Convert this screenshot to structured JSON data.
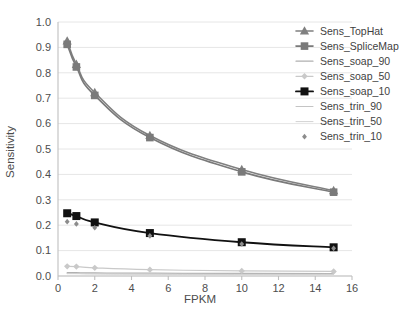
{
  "chart_data": {
    "type": "line",
    "title": "",
    "xlabel": "FPKM",
    "ylabel": "Sensitivity",
    "xlim": [
      0,
      16
    ],
    "ylim": [
      0.0,
      1.0
    ],
    "xticks": [
      0,
      2,
      4,
      6,
      8,
      10,
      12,
      14,
      16
    ],
    "xtick_labels": [
      "0",
      "2",
      "4",
      "6",
      "8",
      "10",
      "12",
      "14",
      "16"
    ],
    "yticks": [
      0.0,
      0.1,
      0.2,
      0.3,
      0.4,
      0.5,
      0.6,
      0.7,
      0.8,
      0.9,
      1.0
    ],
    "ytick_labels": [
      "0.0",
      "0.1",
      "0.2",
      "0.3",
      "0.4",
      "0.5",
      "0.6",
      "0.7",
      "0.8",
      "0.9",
      "1.0"
    ],
    "grid": "horizontal",
    "legend_position": "top-right",
    "x": [
      0.5,
      1,
      2,
      5,
      10,
      15
    ],
    "series": [
      {
        "name": "Sens_TopHat",
        "values": [
          0.925,
          0.833,
          0.722,
          0.553,
          0.419,
          0.336
        ],
        "color": "#808080",
        "marker": "triangle",
        "marker_size": 4.2,
        "line_width": 1.6
      },
      {
        "name": "Sens_SpliceMap",
        "values": [
          0.912,
          0.823,
          0.711,
          0.545,
          0.41,
          0.33
        ],
        "color": "#7a7a7a",
        "marker": "square",
        "marker_size": 3.8,
        "line_width": 1.6
      },
      {
        "name": "Sens_soap_90",
        "values": [
          0.013,
          0.013,
          0.012,
          0.011,
          0.01,
          0.009
        ],
        "color": "#b0b0b0",
        "marker": "none",
        "marker_size": 0,
        "line_width": 1.2
      },
      {
        "name": "Sens_soap_50",
        "values": [
          0.038,
          0.037,
          0.032,
          0.025,
          0.02,
          0.018
        ],
        "color": "#c9c9c9",
        "marker": "diamond",
        "marker_size": 3.2,
        "line_width": 1.2
      },
      {
        "name": "Sens_soap_10",
        "values": [
          0.247,
          0.236,
          0.211,
          0.169,
          0.133,
          0.113
        ],
        "color": "#111111",
        "marker": "square",
        "marker_size": 4.0,
        "line_width": 1.9
      },
      {
        "name": "Sens_trin_90",
        "values": [
          0.01,
          0.01,
          0.009,
          0.008,
          0.007,
          0.007
        ],
        "color": "#c4c4c4",
        "marker": "none",
        "marker_size": 0,
        "line_width": 1.0
      },
      {
        "name": "Sens_trin_50",
        "values": [
          0.009,
          0.009,
          0.008,
          0.007,
          0.006,
          0.006
        ],
        "color": "#d2d2d2",
        "marker": "none",
        "marker_size": 0,
        "line_width": 1.0
      },
      {
        "name": "Sens_trin_10",
        "values": [
          0.214,
          0.205,
          0.19,
          0.158,
          0.126,
          0.109
        ],
        "color": "#8c8c8c",
        "marker": "dot",
        "marker_size": 2.2,
        "line_width": 0
      }
    ]
  },
  "legend": {
    "entries": [
      {
        "label": "Sens_TopHat"
      },
      {
        "label": "Sens_SpliceMap"
      },
      {
        "label": "Sens_soap_90"
      },
      {
        "label": "Sens_soap_50"
      },
      {
        "label": "Sens_soap_10"
      },
      {
        "label": "Sens_trin_90"
      },
      {
        "label": "Sens_trin_50"
      },
      {
        "label": "Sens_trin_10"
      }
    ]
  },
  "axes": {
    "x_title": "FPKM",
    "y_title": "Sensitivity"
  },
  "colors": {
    "background": "#ffffff",
    "grid": "#e6e6e6",
    "axis_line": "#bfbfbf",
    "tick_text": "#4d4d4d"
  }
}
